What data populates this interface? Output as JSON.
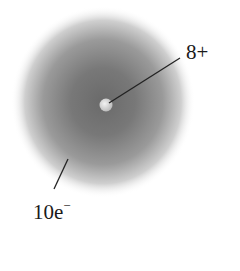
{
  "diagram": {
    "nucleus": {
      "charge_label": "8+",
      "color": "#d8d8d8"
    },
    "electron_cloud": {
      "count_label": "10e",
      "charge_sign": "−",
      "core_color": "#6a6a6a"
    },
    "background": "#ffffff"
  }
}
